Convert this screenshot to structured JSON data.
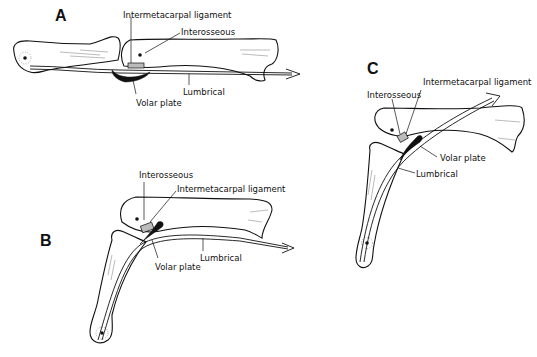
{
  "figure": {
    "panels": [
      {
        "id": "A",
        "letter": "A",
        "labels": {
          "intermetacarpal_ligament": "Intermetacarpal ligament",
          "interosseous": "Interosseous",
          "lumbrical": "Lumbrical",
          "volar_plate": "Volar plate"
        }
      },
      {
        "id": "B",
        "letter": "B",
        "labels": {
          "interosseous": "Interosseous",
          "intermetacarpal_ligament": "Intermetacarpal ligament",
          "volar_plate": "Volar plate",
          "lumbrical": "Lumbrical"
        }
      },
      {
        "id": "C",
        "letter": "C",
        "labels": {
          "interosseous": "Interosseous",
          "intermetacarpal_ligament": "Intermetacarpal ligament",
          "volar_plate": "Volar plate",
          "lumbrical": "Lumbrical"
        }
      }
    ]
  }
}
